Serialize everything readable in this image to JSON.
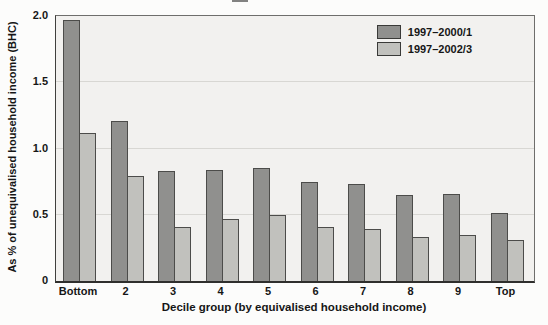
{
  "chart_data": {
    "type": "bar",
    "title": "",
    "categories": [
      "Bottom",
      "2",
      "3",
      "4",
      "5",
      "6",
      "7",
      "8",
      "9",
      "Top"
    ],
    "series": [
      {
        "name": "1997–2000/1",
        "color": "#90908e",
        "values": [
          1.97,
          1.21,
          0.83,
          0.84,
          0.85,
          0.75,
          0.73,
          0.65,
          0.66,
          0.51
        ]
      },
      {
        "name": "1997–2002/3",
        "color": "#c1c1bd",
        "values": [
          1.12,
          0.79,
          0.41,
          0.47,
          0.5,
          0.41,
          0.39,
          0.33,
          0.35,
          0.31
        ]
      }
    ],
    "xlabel": "Decile group (by equivalised household income)",
    "ylabel": "As % of unequivalised household income (BHC)",
    "ylim": [
      0,
      2.0
    ],
    "yticks": [
      0,
      0.5,
      1.0,
      1.5,
      2.0
    ],
    "ytick_labels": [
      "0",
      "0.5",
      "1.0",
      "1.5",
      "2.0"
    ],
    "grid": "horizontal",
    "legend_position": "top-right"
  },
  "colors": {
    "plot_background": "#f2f1ef",
    "gridline": "#d8d7d3",
    "axis_line": "#2f2f2d",
    "text": "#161616",
    "page_background": "#fcfcfb"
  }
}
